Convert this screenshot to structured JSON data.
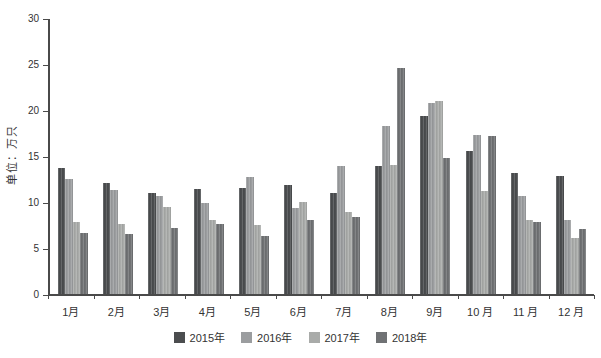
{
  "chart_data": {
    "type": "bar",
    "title": "",
    "ylabel": "单位：万只",
    "xlabel": "",
    "ylim": [
      0,
      30
    ],
    "yticks": [
      0,
      5,
      10,
      15,
      20,
      25,
      30
    ],
    "grid": false,
    "legend_position": "bottom",
    "categories": [
      "1月",
      "2月",
      "3月",
      "4月",
      "5月",
      "6月",
      "7月",
      "8月",
      "9月",
      "10 月",
      "11 月",
      "12 月"
    ],
    "series": [
      {
        "name": "2015年",
        "color": "#4b4d4f",
        "values": [
          13.7,
          12.1,
          11.0,
          11.4,
          11.5,
          11.9,
          11.0,
          13.9,
          19.4,
          15.5,
          13.1,
          12.8
        ]
      },
      {
        "name": "2016年",
        "color": "#9b9d9f",
        "values": [
          12.5,
          11.3,
          10.7,
          9.9,
          12.7,
          9.3,
          13.9,
          18.3,
          20.8,
          17.3,
          10.7,
          8.0
        ]
      },
      {
        "name": "2017年",
        "color": "#a9aba9",
        "values": [
          7.8,
          7.6,
          9.5,
          8.0,
          7.5,
          10.0,
          8.9,
          14.0,
          21.0,
          11.2,
          8.0,
          6.1
        ]
      },
      {
        "name": "2018年",
        "color": "#707274",
        "values": [
          6.6,
          6.5,
          7.2,
          7.6,
          6.3,
          8.0,
          8.4,
          24.6,
          14.8,
          17.2,
          7.8,
          7.1
        ]
      }
    ]
  },
  "layout_colors": {
    "axis": "#4a4a4a",
    "text": "#333333",
    "background": "#ffffff"
  }
}
